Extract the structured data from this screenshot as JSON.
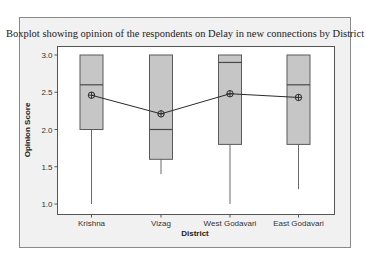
{
  "chart_data": {
    "type": "boxplot",
    "title": "Boxplot showing opinion of the respondents on Delay in new connections by District",
    "xlabel": "District",
    "ylabel": "Opinion Score",
    "ylim": [
      0.95,
      3.05
    ],
    "yticks": [
      1.0,
      1.5,
      2.0,
      2.5,
      3.0
    ],
    "ytick_labels": [
      "1.0",
      "1.5",
      "2.0",
      "2.5",
      "3.0"
    ],
    "grid": false,
    "legend": "none",
    "categories": [
      "Krishna",
      "Vizag",
      "West Godavari",
      "East Godavari"
    ],
    "series": [
      {
        "name": "Krishna",
        "min": 1.0,
        "q1": 2.0,
        "median": 2.6,
        "q3": 3.0,
        "max": 3.0,
        "mean": 2.46
      },
      {
        "name": "Vizag",
        "min": 1.4,
        "q1": 1.6,
        "median": 2.0,
        "q3": 3.0,
        "max": 3.0,
        "mean": 2.21
      },
      {
        "name": "West Godavari",
        "min": 1.0,
        "q1": 1.8,
        "median": 2.9,
        "q3": 3.0,
        "max": 3.0,
        "mean": 2.48
      },
      {
        "name": "East Godavari",
        "min": 1.2,
        "q1": 1.8,
        "median": 2.6,
        "q3": 3.0,
        "max": 3.0,
        "mean": 2.43
      }
    ],
    "mean_line": {
      "connected": true,
      "marker": "circle-crosshair",
      "values": [
        2.46,
        2.21,
        2.48,
        2.43
      ]
    },
    "colors": {
      "box_fill": "#c6c6c6",
      "box_stroke": "#5a5a5a",
      "median_line": "#4a4a4a",
      "mean_line": "#2a2a2a",
      "plot_background": "#ffffff",
      "frame_background": "#f1f1f1",
      "frame_border": "#8a8a8a"
    }
  }
}
